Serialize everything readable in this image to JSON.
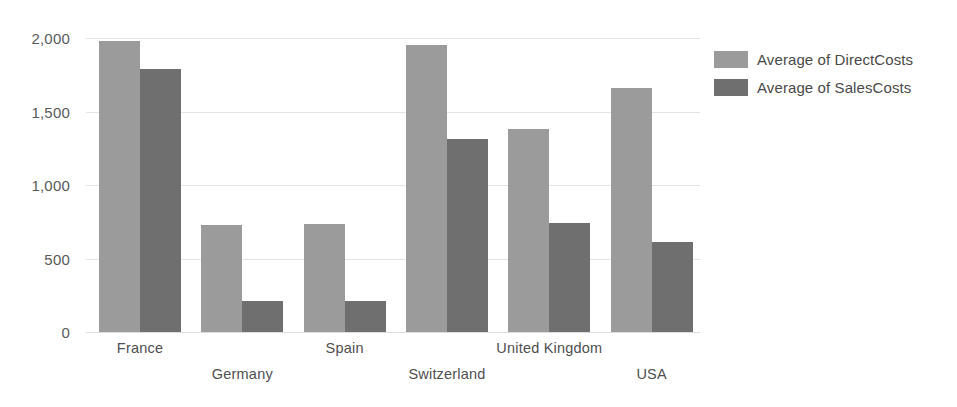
{
  "chart_data": {
    "type": "bar",
    "title": "",
    "xlabel": "",
    "ylabel": "",
    "categories": [
      "France",
      "Germany",
      "Spain",
      "Switzerland",
      "United Kingdom",
      "USA"
    ],
    "series": [
      {
        "name": "Average of DirectCosts",
        "color": "#9b9b9b",
        "values": [
          1980,
          730,
          735,
          1955,
          1380,
          1660
        ]
      },
      {
        "name": "Average of SalesCosts",
        "color": "#6f6f6f",
        "values": [
          1790,
          210,
          210,
          1310,
          740,
          610
        ]
      }
    ],
    "ylim": [
      0,
      2000
    ],
    "yticks": [
      0,
      500,
      1000,
      1500,
      2000
    ],
    "ytick_labels": [
      "0",
      "500",
      "1,000",
      "1,500",
      "2,000"
    ],
    "grid": true,
    "legend_position": "right",
    "xtick_label_rows": [
      0,
      1,
      0,
      1,
      0,
      1
    ]
  }
}
